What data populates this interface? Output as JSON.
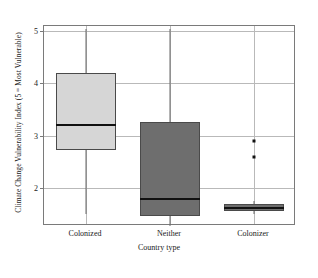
{
  "chart_data": {
    "type": "box",
    "title": "",
    "xlabel": "Country type",
    "ylabel": "Climate Change Vulnerability Index (5 = Most Vulnerable)",
    "categories": [
      "Colonized",
      "Neither",
      "Colonizer"
    ],
    "yticks": [
      2,
      3,
      4,
      5
    ],
    "yticklabels": [
      "2",
      "3",
      "4",
      "5"
    ],
    "ylim": [
      1.27,
      5.1
    ],
    "grid": "horizontal-and-vertical",
    "legend": "none",
    "boxes": [
      {
        "category": "Colonized",
        "fill": "#d6d6d6",
        "q1": 2.72,
        "median": 3.2,
        "q3": 4.2,
        "whisker_low": 1.5,
        "whisker_high": 5.05,
        "outliers": []
      },
      {
        "category": "Neither",
        "fill": "#6e6e6e",
        "q1": 1.47,
        "median": 1.78,
        "q3": 3.27,
        "whisker_low": 1.27,
        "whisker_high": 5.05,
        "outliers": []
      },
      {
        "category": "Colonizer",
        "fill": "#6e6e6e",
        "q1": 1.55,
        "median": 1.62,
        "q3": 1.7,
        "whisker_low": 1.5,
        "whisker_high": 1.75,
        "outliers": [
          2.9,
          2.6
        ]
      }
    ],
    "colors": {
      "light_box": "#d6d6d6",
      "dark_box": "#6e6e6e",
      "median_line": "#111111",
      "grid": "#b9b9b9",
      "frame": "#7a7a7a"
    }
  }
}
